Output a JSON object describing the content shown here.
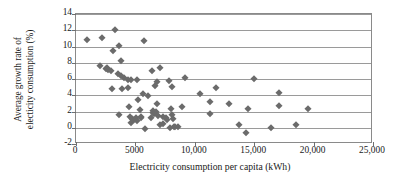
{
  "chart_data": {
    "type": "scatter",
    "title": "",
    "xlabel": "Electricity consumption per capita (kWh)",
    "ylabel_line1": "Average growth rate of",
    "ylabel_line2": "electicity consumption (%)",
    "xlim": [
      0,
      25000
    ],
    "ylim": [
      -2,
      14
    ],
    "xticks": [
      0,
      5000,
      10000,
      15000,
      20000,
      25000
    ],
    "xticklabels": [
      "0",
      "5000",
      "10,000",
      "15,000",
      "20,000",
      "25,000"
    ],
    "yticks": [
      -2,
      0,
      2,
      4,
      6,
      8,
      10,
      12,
      14
    ],
    "yticklabels": [
      "-2",
      "0",
      "2",
      "4",
      "6",
      "8",
      "10",
      "12",
      "14"
    ],
    "grid": "horizontal",
    "legend": "none",
    "marker": "diamond",
    "marker_color": "#6b6b6b",
    "points": [
      [
        900,
        10.8
      ],
      [
        2150,
        11.0
      ],
      [
        3300,
        12.0
      ],
      [
        3150,
        9.5
      ],
      [
        3600,
        10.1
      ],
      [
        5750,
        10.65
      ],
      [
        2050,
        7.65
      ],
      [
        2500,
        7.2
      ],
      [
        2600,
        7.35
      ],
      [
        2700,
        7.1
      ],
      [
        2950,
        6.95
      ],
      [
        3750,
        8.2
      ],
      [
        3500,
        6.6
      ],
      [
        3750,
        6.4
      ],
      [
        4050,
        6.1
      ],
      [
        4350,
        5.9
      ],
      [
        4600,
        5.85
      ],
      [
        5150,
        5.9
      ],
      [
        6400,
        6.95
      ],
      [
        7100,
        7.4
      ],
      [
        3000,
        4.8
      ],
      [
        3850,
        4.8
      ],
      [
        4400,
        4.85
      ],
      [
        5600,
        4.2
      ],
      [
        6050,
        3.95
      ],
      [
        6650,
        5.2
      ],
      [
        6850,
        5.6
      ],
      [
        7850,
        5.8
      ],
      [
        8050,
        5.0
      ],
      [
        9150,
        6.15
      ],
      [
        10400,
        4.1
      ],
      [
        11300,
        3.15
      ],
      [
        11750,
        4.9
      ],
      [
        11300,
        1.65
      ],
      [
        12850,
        2.9
      ],
      [
        14950,
        6.05
      ],
      [
        13750,
        0.35
      ],
      [
        14500,
        2.35
      ],
      [
        16450,
        0.0
      ],
      [
        14350,
        -0.7
      ],
      [
        17050,
        4.3
      ],
      [
        17050,
        2.7
      ],
      [
        18500,
        0.4
      ],
      [
        19550,
        2.35
      ],
      [
        3650,
        1.55
      ],
      [
        4500,
        2.5
      ],
      [
        4550,
        1.3
      ],
      [
        4600,
        0.6
      ],
      [
        4750,
        1.05
      ],
      [
        4900,
        1.0
      ],
      [
        5050,
        1.25
      ],
      [
        5100,
        0.85
      ],
      [
        5250,
        3.45
      ],
      [
        5350,
        2.15
      ],
      [
        5450,
        1.3
      ],
      [
        5500,
        1.2
      ],
      [
        5850,
        -0.1
      ],
      [
        6450,
        2.05
      ],
      [
        6500,
        1.85
      ],
      [
        6600,
        1.7
      ],
      [
        6750,
        2.0
      ],
      [
        6800,
        2.9
      ],
      [
        6900,
        1.4
      ],
      [
        7100,
        0.4
      ],
      [
        7300,
        0.45
      ],
      [
        7350,
        1.3
      ],
      [
        7600,
        1.25
      ],
      [
        7700,
        1.0
      ],
      [
        8000,
        2.35
      ],
      [
        8100,
        1.55
      ],
      [
        8200,
        1.1
      ],
      [
        8250,
        0.15
      ],
      [
        8350,
        0.05
      ],
      [
        8600,
        0.1
      ],
      [
        8900,
        2.55
      ],
      [
        7950,
        -0.05
      ],
      [
        6350,
        1.2
      ]
    ]
  }
}
